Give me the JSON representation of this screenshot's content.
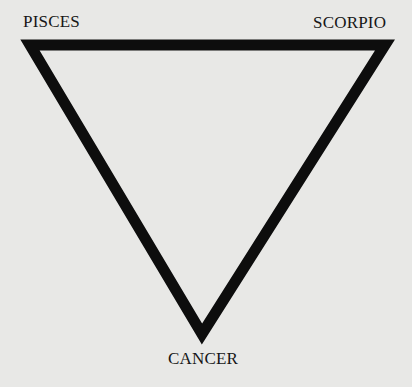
{
  "diagram": {
    "shape": "inverted-triangle",
    "stroke_color": "#0d0d0d",
    "background_color": "#e8e8e6",
    "vertices": {
      "top_left": {
        "label": "PISCES"
      },
      "top_right": {
        "label": "SCORPIO"
      },
      "bottom": {
        "label": "CANCER"
      }
    }
  }
}
